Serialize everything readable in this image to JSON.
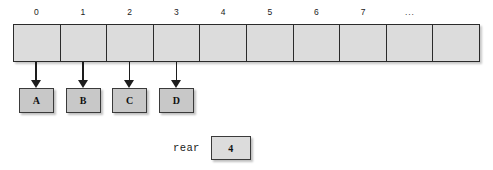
{
  "diagram": {
    "colors": {
      "cell_fill": "#dcdcdc",
      "value_box_fill": "#c8c8c8",
      "border": "#2b2b2b",
      "arrow": "#1d1d1d",
      "text": "#111111",
      "background": "#ffffff"
    }
  },
  "array": {
    "cell_count": 10,
    "index_labels": [
      "0",
      "1",
      "2",
      "3",
      "4",
      "5",
      "6",
      "7",
      "...",
      ""
    ],
    "cells": [
      {
        "index": "0",
        "content": ""
      },
      {
        "index": "1",
        "content": ""
      },
      {
        "index": "2",
        "content": ""
      },
      {
        "index": "3",
        "content": ""
      },
      {
        "index": "4",
        "content": ""
      },
      {
        "index": "5",
        "content": ""
      },
      {
        "index": "6",
        "content": ""
      },
      {
        "index": "7",
        "content": ""
      },
      {
        "index": "...",
        "content": ""
      },
      {
        "index": "",
        "content": ""
      }
    ]
  },
  "values": [
    {
      "label": "A",
      "cell_index": "0"
    },
    {
      "label": "B",
      "cell_index": "1"
    },
    {
      "label": "C",
      "cell_index": "2"
    },
    {
      "label": "D",
      "cell_index": "3"
    }
  ],
  "rear": {
    "label": "rear",
    "value": "4"
  }
}
